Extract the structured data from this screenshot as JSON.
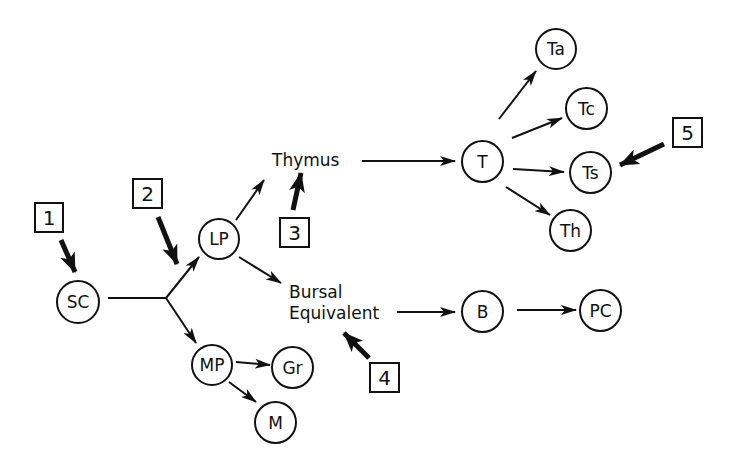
{
  "diagram": {
    "type": "lineage-flow",
    "nodes": {
      "sc": "SC",
      "lp": "LP",
      "mp": "MP",
      "gr": "Gr",
      "m": "M",
      "t": "T",
      "ta": "Ta",
      "tc": "Tc",
      "ts": "Ts",
      "th": "Th",
      "b": "B",
      "pc": "PC"
    },
    "organs": {
      "thymus": "Thymus",
      "bursal_line1": "Bursal",
      "bursal_line2": "Equivalent"
    },
    "markers": {
      "m1": "1",
      "m2": "2",
      "m3": "3",
      "m4": "4",
      "m5": "5"
    },
    "edges": [
      [
        "SC",
        "junction"
      ],
      [
        "junction",
        "LP"
      ],
      [
        "junction",
        "MP"
      ],
      [
        "LP",
        "Thymus"
      ],
      [
        "LP",
        "Bursal Equivalent"
      ],
      [
        "Thymus",
        "T"
      ],
      [
        "T",
        "Ta"
      ],
      [
        "T",
        "Tc"
      ],
      [
        "T",
        "Ts"
      ],
      [
        "T",
        "Th"
      ],
      [
        "Bursal Equivalent",
        "B"
      ],
      [
        "B",
        "PC"
      ],
      [
        "MP",
        "Gr"
      ],
      [
        "MP",
        "M"
      ]
    ],
    "marker_targets": {
      "1": "SC",
      "2": "LP/MP branch",
      "3": "Thymus",
      "4": "Bursal Equivalent",
      "5": "Ts"
    }
  }
}
